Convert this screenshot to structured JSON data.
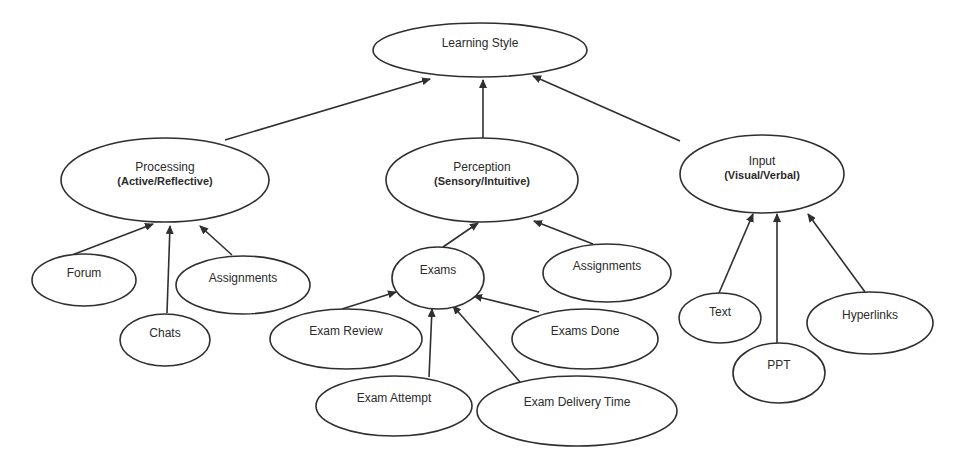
{
  "diagram": {
    "title": "Learning Style",
    "colors": {
      "stroke": "#2f2f2f",
      "fill": "#ffffff",
      "text": "#2b2b2b"
    },
    "nodes": [
      {
        "id": "learning-style",
        "label": "Learning Style",
        "sub": "",
        "cx": 480,
        "cy": 50,
        "rx": 107,
        "ry": 27
      },
      {
        "id": "processing",
        "label": "Processing",
        "sub": "(Active/Reflective)",
        "cx": 165,
        "cy": 180,
        "rx": 104,
        "ry": 42
      },
      {
        "id": "perception",
        "label": "Perception",
        "sub": "(Sensory/Intuitive)",
        "cx": 482,
        "cy": 180,
        "rx": 96,
        "ry": 42
      },
      {
        "id": "input",
        "label": "Input",
        "sub": "(Visual/Verbal)",
        "cx": 762,
        "cy": 174,
        "rx": 82,
        "ry": 39
      },
      {
        "id": "forum",
        "label": "Forum",
        "sub": "",
        "cx": 84,
        "cy": 280,
        "rx": 52,
        "ry": 26
      },
      {
        "id": "assignments-processing",
        "label": "Assignments",
        "sub": "",
        "cx": 243,
        "cy": 285,
        "rx": 67,
        "ry": 29
      },
      {
        "id": "chats",
        "label": "Chats",
        "sub": "",
        "cx": 165,
        "cy": 340,
        "rx": 45,
        "ry": 26
      },
      {
        "id": "exams",
        "label": "Exams",
        "sub": "",
        "cx": 438,
        "cy": 278,
        "rx": 46,
        "ry": 31
      },
      {
        "id": "assignments-perception",
        "label": "Assignments",
        "sub": "",
        "cx": 607,
        "cy": 273,
        "rx": 64,
        "ry": 29
      },
      {
        "id": "exam-review",
        "label": "Exam Review",
        "sub": "",
        "cx": 346,
        "cy": 339,
        "rx": 76,
        "ry": 30
      },
      {
        "id": "exams-done",
        "label": "Exams Done",
        "sub": "",
        "cx": 585,
        "cy": 339,
        "rx": 73,
        "ry": 30
      },
      {
        "id": "exam-attempt",
        "label": "Exam Attempt",
        "sub": "",
        "cx": 394,
        "cy": 406,
        "rx": 78,
        "ry": 30
      },
      {
        "id": "exam-delivery-time",
        "label": "Exam Delivery Time",
        "sub": "",
        "cx": 577,
        "cy": 411,
        "rx": 100,
        "ry": 35
      },
      {
        "id": "text",
        "label": "Text",
        "sub": "",
        "cx": 720,
        "cy": 318,
        "rx": 41,
        "ry": 25
      },
      {
        "id": "ppt",
        "label": "PPT",
        "sub": "",
        "cx": 779,
        "cy": 373,
        "rx": 46,
        "ry": 30
      },
      {
        "id": "hyperlinks",
        "label": "Hyperlinks",
        "sub": "",
        "cx": 870,
        "cy": 323,
        "rx": 63,
        "ry": 31
      }
    ],
    "edges": [
      {
        "from": "processing",
        "to": "learning-style",
        "x1": 225,
        "y1": 140,
        "x2": 430,
        "y2": 79
      },
      {
        "from": "perception",
        "to": "learning-style",
        "x1": 483,
        "y1": 138,
        "x2": 483,
        "y2": 80
      },
      {
        "from": "input",
        "to": "learning-style",
        "x1": 680,
        "y1": 141,
        "x2": 533,
        "y2": 76
      },
      {
        "from": "forum",
        "to": "processing",
        "x1": 72,
        "y1": 255,
        "x2": 153,
        "y2": 224
      },
      {
        "from": "chats",
        "to": "processing",
        "x1": 167,
        "y1": 313,
        "x2": 170,
        "y2": 226
      },
      {
        "from": "assignments-processing",
        "to": "processing",
        "x1": 232,
        "y1": 255,
        "x2": 200,
        "y2": 226
      },
      {
        "from": "exams",
        "to": "perception",
        "x1": 443,
        "y1": 247,
        "x2": 478,
        "y2": 223
      },
      {
        "from": "assignments-perception",
        "to": "perception",
        "x1": 593,
        "y1": 244,
        "x2": 534,
        "y2": 221
      },
      {
        "from": "exam-review",
        "to": "exams",
        "x1": 342,
        "y1": 309,
        "x2": 396,
        "y2": 292
      },
      {
        "from": "exam-attempt",
        "to": "exams",
        "x1": 429,
        "y1": 377,
        "x2": 432,
        "y2": 309
      },
      {
        "from": "exam-delivery-time",
        "to": "exams",
        "x1": 520,
        "y1": 382,
        "x2": 453,
        "y2": 306
      },
      {
        "from": "exams-done",
        "to": "exams",
        "x1": 539,
        "y1": 312,
        "x2": 474,
        "y2": 296
      },
      {
        "from": "text",
        "to": "input",
        "x1": 719,
        "y1": 293,
        "x2": 753,
        "y2": 214
      },
      {
        "from": "ppt",
        "to": "input",
        "x1": 777,
        "y1": 343,
        "x2": 777,
        "y2": 214
      },
      {
        "from": "hyperlinks",
        "to": "input",
        "x1": 865,
        "y1": 292,
        "x2": 808,
        "y2": 214
      }
    ]
  }
}
